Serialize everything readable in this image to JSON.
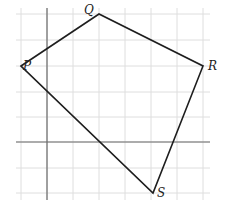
{
  "diagram": {
    "type": "coordinate-grid-quadrilateral",
    "grid": {
      "x_lines": [
        21,
        47,
        73,
        99,
        125,
        151,
        177,
        203
      ],
      "y_lines": [
        14,
        40,
        66,
        92,
        117,
        142,
        168,
        193
      ],
      "x_extent": [
        16,
        210
      ],
      "y_extent": [
        8,
        200
      ],
      "color": "#dedede"
    },
    "axes": {
      "x_axis_y": 142,
      "y_axis_x": 47,
      "color": "#6b6b6b"
    },
    "vertices": [
      {
        "name": "P",
        "x": 21,
        "y": 66,
        "label_dx": 2,
        "label_dy": 4
      },
      {
        "name": "Q",
        "x": 99,
        "y": 14,
        "label_dx": -15,
        "label_dy": 0
      },
      {
        "name": "R",
        "x": 203,
        "y": 66,
        "label_dx": 5,
        "label_dy": 4
      },
      {
        "name": "S",
        "x": 153,
        "y": 193,
        "label_dx": 4,
        "label_dy": 4
      }
    ],
    "edges": [
      [
        "P",
        "Q"
      ],
      [
        "Q",
        "R"
      ],
      [
        "R",
        "S"
      ],
      [
        "S",
        "P"
      ]
    ],
    "edge_color": "#1e1e1e"
  }
}
